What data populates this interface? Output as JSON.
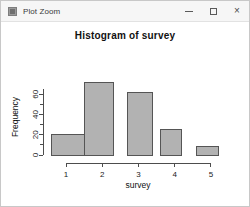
{
  "window": {
    "title": "Plot Zoom",
    "icon": "plot-window-icon",
    "controls": {
      "minimize": "–",
      "maximize": "□",
      "close": "×"
    }
  },
  "colors": {
    "bar_fill": "#b2b2b2",
    "bar_border": "#555555",
    "axis": "#4d4d4d",
    "titlebar": "#f6f6f6",
    "plot_background": "#ffffff"
  },
  "chart_data": {
    "type": "bar",
    "title": "Histogram of survey",
    "xlabel": "survey",
    "ylabel": "Frequency",
    "categories": [
      "1",
      "2",
      "3",
      "4",
      "5"
    ],
    "bin_edges": [
      0.5,
      1.5,
      2.0,
      2.5,
      3.5,
      4.0,
      4.5,
      5.5
    ],
    "bars": [
      {
        "label": "1",
        "left": 0.6,
        "right": 1.5,
        "value": 20
      },
      {
        "label": "2",
        "left": 1.5,
        "right": 2.3,
        "value": 72
      },
      {
        "label": "3",
        "left": 2.7,
        "right": 3.4,
        "value": 62
      },
      {
        "label": "4",
        "left": 3.6,
        "right": 4.2,
        "value": 25
      },
      {
        "label": "5",
        "left": 4.6,
        "right": 5.2,
        "value": 8
      }
    ],
    "values": [
      20,
      72,
      62,
      25,
      8
    ],
    "xticks": [
      "1",
      "2",
      "3",
      "4",
      "5"
    ],
    "xtick_values": [
      1,
      2,
      3,
      4,
      5
    ],
    "yticks": [
      "0",
      "20",
      "40",
      "60"
    ],
    "ytick_values": [
      0,
      20,
      40,
      60
    ],
    "yminor_values": [
      10,
      30,
      50,
      70
    ],
    "xlim": [
      0.5,
      5.5
    ],
    "ylim": [
      0,
      75
    ],
    "grid": false,
    "legend": null
  }
}
